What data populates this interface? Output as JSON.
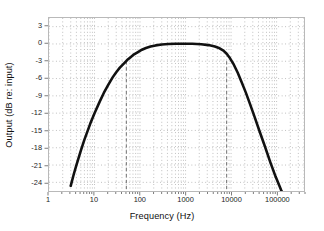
{
  "chart_data": {
    "type": "line",
    "title": "",
    "xlabel": "Frequency (Hz)",
    "ylabel": "Output (dB re: input)",
    "xscale": "log",
    "xlim": [
      1,
      400000
    ],
    "ylim": [
      -25.5,
      4.5
    ],
    "xticks": [
      1,
      10,
      100,
      1000,
      10000,
      100000
    ],
    "xticklabels": [
      "1",
      "10",
      "100",
      "1000",
      "10000",
      "100000"
    ],
    "yticks": [
      3,
      0,
      -3,
      -6,
      -9,
      -12,
      -15,
      -18,
      -21,
      -24
    ],
    "yticklabels": [
      "3",
      "0",
      "-3",
      "-6",
      "-9",
      "-12",
      "-15",
      "-18",
      "-21",
      "-24"
    ],
    "grid": "dotted-both-axes",
    "grid_color": "#9a9a9a",
    "legend": "none",
    "series": [
      {
        "name": "Bandpass frequency response",
        "color": "#111111",
        "linewidth": 2.6,
        "x": [
          3.0,
          3.5,
          4,
          5,
          6,
          8,
          10,
          13,
          16,
          20,
          25,
          30,
          36,
          44,
          52,
          62,
          74,
          90,
          110,
          135,
          170,
          220,
          300,
          420,
          600,
          900,
          1400,
          2200,
          3200,
          4400,
          5600,
          6800,
          8000,
          9500,
          11500,
          14000,
          17000,
          21000,
          26000,
          33000,
          42000,
          55000,
          72000,
          95000,
          125000,
          160000
        ],
        "y": [
          -24.6,
          -22.6,
          -21.0,
          -18.5,
          -16.6,
          -13.9,
          -12.0,
          -10.0,
          -8.5,
          -7.1,
          -5.8,
          -4.9,
          -4.1,
          -3.4,
          -2.8,
          -2.3,
          -1.8,
          -1.4,
          -1.0,
          -0.7,
          -0.45,
          -0.25,
          -0.1,
          -0.02,
          0.02,
          0.05,
          0.03,
          -0.05,
          -0.2,
          -0.45,
          -0.75,
          -1.15,
          -1.7,
          -2.5,
          -3.6,
          -5.0,
          -6.6,
          -8.4,
          -10.4,
          -12.7,
          -15.1,
          -17.7,
          -20.4,
          -23.0,
          -25.3,
          -27.0
        ]
      }
    ],
    "annotations": [
      {
        "type": "vline",
        "x": 50,
        "style": "dashed",
        "color": "#6f6f6f",
        "label": "lower -3 dB cutoff"
      },
      {
        "type": "vline",
        "x": 8000,
        "style": "dashed",
        "color": "#6f6f6f",
        "label": "upper -3 dB cutoff"
      }
    ]
  }
}
